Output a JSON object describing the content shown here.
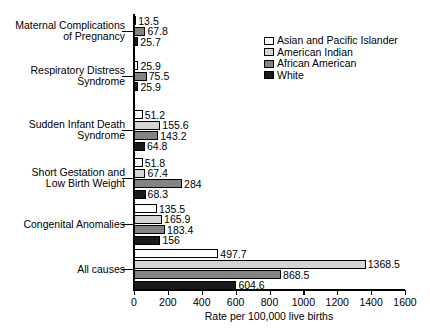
{
  "chart_data": {
    "type": "bar",
    "orientation": "horizontal",
    "title": "",
    "xlabel": "Rate per 100,000 live births",
    "ylabel": "",
    "xlim": [
      0,
      1600
    ],
    "xticks": [
      0,
      200,
      400,
      600,
      800,
      1000,
      1200,
      1400,
      1600
    ],
    "xtick_labels": [
      "0",
      "200",
      "400",
      "600",
      "800",
      "1000",
      "1200",
      "1400",
      "1600"
    ],
    "grid": false,
    "legend_position": "top-right",
    "categories": [
      "Maternal Complications\nof Pregnancy",
      "Respiratory Distress\nSyndrome",
      "Sudden Infant Death\nSyndrome",
      "Short Gestation and\nLow Birth Weight",
      "Congenital Anomalies",
      "All causes"
    ],
    "series": [
      {
        "name": "Asian and Pacific Islander",
        "color": "#ffffff",
        "values": [
          13.5,
          25.9,
          51.2,
          51.8,
          135.5,
          497.7
        ],
        "labels": [
          "13.5",
          "25.9",
          "51.2",
          "51.8",
          "135.5",
          "497.7"
        ]
      },
      {
        "name": "American Indian",
        "color": "#d4d4d4",
        "values": [
          null,
          null,
          155.6,
          67.4,
          165.9,
          1368.5
        ],
        "labels": [
          "",
          "",
          "155.6",
          "67.4",
          "165.9",
          "1368.5"
        ]
      },
      {
        "name": "African American",
        "color": "#838383",
        "values": [
          67.8,
          75.5,
          143.2,
          284,
          183.4,
          868.5
        ],
        "labels": [
          "67.8",
          "75.5",
          "143.2",
          "284",
          "183.4",
          "868.5"
        ]
      },
      {
        "name": "White",
        "color": "#1a1a1a",
        "values": [
          25.7,
          25.9,
          64.8,
          68.3,
          156,
          604.6
        ],
        "labels": [
          "25.7",
          "25.9",
          "64.8",
          "68.3",
          "156",
          "604.6"
        ]
      }
    ]
  }
}
